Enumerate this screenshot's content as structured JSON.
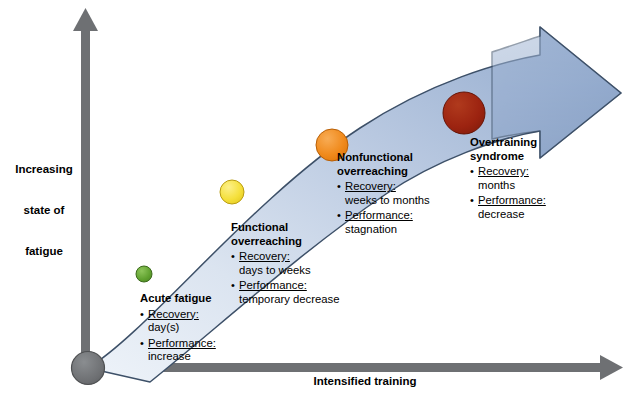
{
  "figure": {
    "axes": {
      "y_label": "Increasing\nstate of\nfatigue",
      "y_label_line1": "Increasing",
      "y_label_line2": "state of",
      "y_label_line3": "fatigue",
      "x_label": "Intensified training",
      "axis_color": "#6e7073",
      "origin_color": "#6a6c6f"
    },
    "arrow": {
      "fill_start": "#e8eef7",
      "fill_end": "#92aacd",
      "stroke": "#3d5068",
      "name": "curved-progression-arrow"
    },
    "stages": [
      {
        "id": "acute-fatigue",
        "title": "Acute fatigue",
        "marker_color": "#5fa02e",
        "marker_radius": 8,
        "recovery_label": "Recovery:",
        "recovery_value": "day(s)",
        "performance_label": "Performance:",
        "performance_value": "increase"
      },
      {
        "id": "functional-overreaching",
        "title": "Functional\noverreaching",
        "title_line1": "Functional",
        "title_line2": "overreaching",
        "marker_color": "#f5e03c",
        "marker_radius": 12,
        "recovery_label": "Recovery:",
        "recovery_value": "days to weeks",
        "performance_label": "Performance:",
        "performance_value": "temporary decrease"
      },
      {
        "id": "nonfunctional-overreaching",
        "title": "Nonfunctional\noverreaching",
        "title_line1": "Nonfunctional",
        "title_line2": "overreaching",
        "marker_color": "#f08a1c",
        "marker_radius": 16,
        "recovery_label": "Recovery:",
        "recovery_value": "weeks to months",
        "performance_label": "Performance:",
        "performance_value": "stagnation"
      },
      {
        "id": "overtraining-syndrome",
        "title": "Overtraining\nsyndrome",
        "title_line1": "Overtraining",
        "title_line2": "syndrome",
        "marker_color": "#9c2310",
        "marker_radius": 21,
        "recovery_label": "Recovery:",
        "recovery_value": "months",
        "performance_label": "Performance:",
        "performance_value": "decrease"
      }
    ]
  }
}
